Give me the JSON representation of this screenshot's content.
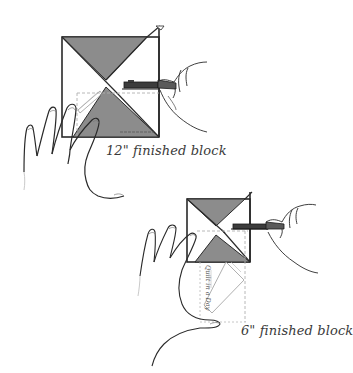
{
  "figure": {
    "colors": {
      "fabric_dark": "#8c8c8c",
      "fabric_light": "#ffffff",
      "outline": "#2a2a2a",
      "ruler_guides": "#b0b0b0",
      "cutter_handle": "#3c3c3c"
    },
    "panels": [
      {
        "id": "large",
        "caption": "12\" finished block",
        "block": {
          "x": 62,
          "y": 37,
          "size": 97
        },
        "ruler_label": ""
      },
      {
        "id": "small",
        "caption": "6\" finished block",
        "block": {
          "x": 187,
          "y": 199,
          "size": 63
        },
        "ruler_label": "Quilt in a Day"
      }
    ]
  }
}
